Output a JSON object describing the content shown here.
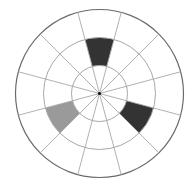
{
  "diagram": {
    "type": "polar-grid",
    "center": [
      99.5,
      93.5
    ],
    "rings": [
      28,
      56,
      84
    ],
    "spoke_count": 12,
    "spoke_offset_deg": 15,
    "colors": {
      "background": "#ffffff",
      "outer_ring_stroke": "#6a6a6a",
      "inner_ring_stroke": "#a8a8a8",
      "spoke_stroke": "#a8a8a8",
      "center_dot": "#111111"
    },
    "filled_cells": [
      {
        "name": "top-cell",
        "ring_index": 1,
        "start_deg": -15,
        "end_deg": 15,
        "color": "#333333"
      },
      {
        "name": "lower-right-cell",
        "ring_index": 1,
        "start_deg": 105,
        "end_deg": 135,
        "color": "#333333"
      },
      {
        "name": "lower-left-cell",
        "ring_index": 1,
        "start_deg": 225,
        "end_deg": 255,
        "color": "#9a9a9a"
      }
    ]
  }
}
